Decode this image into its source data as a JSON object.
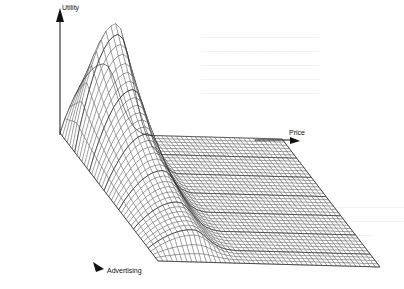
{
  "chart_data": {
    "type": "surface",
    "title": "",
    "axes": {
      "z": {
        "label": "Utility"
      },
      "x": {
        "label": "Price"
      },
      "y": {
        "label": "Advertising"
      }
    },
    "grid_resolution": {
      "price_steps": 46,
      "advertising_steps": 40
    },
    "price_range": [
      0,
      1
    ],
    "advertising_range": [
      0,
      1
    ],
    "utility_range": [
      0,
      1
    ],
    "surface_model": {
      "peak": {
        "price": 0.2,
        "advertising": 0.12,
        "utility": 1.0
      },
      "ridge_price": 0.2,
      "ridge_width": 0.09,
      "advertising_decay": 1.6,
      "flat_region_start_price": 0.38,
      "flat_utility": 0.0
    },
    "colors": {
      "mesh_line": "#3a3a3a",
      "mesh_fill": "#ffffff",
      "axis": "#111111"
    }
  }
}
